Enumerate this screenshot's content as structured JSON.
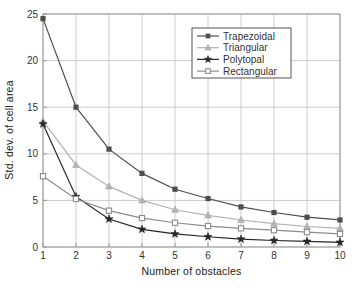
{
  "figure": {
    "background": "#ffffff",
    "text_color": "#222222"
  },
  "chart_data": {
    "type": "line",
    "title": "",
    "xlabel": "Number of obstacles",
    "ylabel": "Std. dev. of cell area",
    "x": [
      1,
      2,
      3,
      4,
      5,
      6,
      7,
      8,
      9,
      10
    ],
    "xlim": [
      1,
      10
    ],
    "ylim": [
      0,
      25
    ],
    "xticks": [
      1,
      2,
      3,
      4,
      5,
      6,
      7,
      8,
      9,
      10
    ],
    "yticks": [
      0,
      5,
      10,
      15,
      20,
      25
    ],
    "grid": true,
    "legend_position": "upper-center",
    "series": [
      {
        "name": "Trapezoidal",
        "marker": "filled-square",
        "color": "#4d4d4d",
        "values": [
          24.5,
          15.0,
          10.5,
          7.9,
          6.2,
          5.2,
          4.3,
          3.7,
          3.2,
          2.9
        ]
      },
      {
        "name": "Triangular",
        "marker": "filled-triangle",
        "color": "#b3b3b3",
        "values": [
          13.5,
          8.8,
          6.5,
          5.0,
          4.0,
          3.4,
          2.9,
          2.5,
          2.2,
          2.0
        ]
      },
      {
        "name": "Polytopal",
        "marker": "star",
        "color": "#262626",
        "values": [
          13.2,
          5.4,
          3.0,
          1.9,
          1.4,
          1.1,
          0.85,
          0.7,
          0.6,
          0.5
        ]
      },
      {
        "name": "Rectangular",
        "marker": "open-square",
        "color": "#8c8c8c",
        "values": [
          7.6,
          5.15,
          3.9,
          3.1,
          2.6,
          2.25,
          2.0,
          1.8,
          1.6,
          1.4
        ]
      }
    ],
    "colors": {
      "grid": "#cccccc",
      "axis_box": "#999999",
      "tick_text": "#333333",
      "legend_border": "#555555",
      "legend_background": "#ffffff"
    }
  }
}
